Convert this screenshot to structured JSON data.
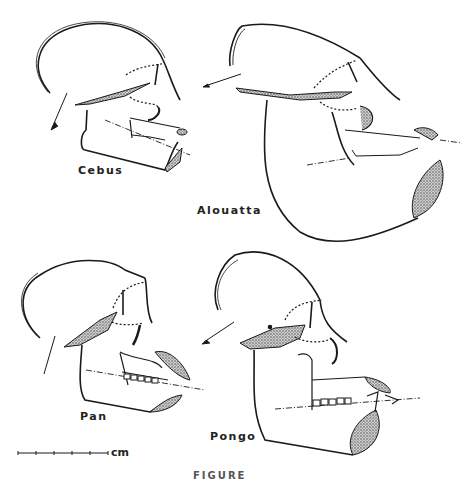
{
  "figure": {
    "caption": "FIGURE",
    "panels": [
      {
        "id": "cebus",
        "label": "Cebus"
      },
      {
        "id": "alouatta",
        "label": "Alouatta"
      },
      {
        "id": "pan",
        "label": "Pan"
      },
      {
        "id": "pongo",
        "label": "Pongo"
      }
    ],
    "scale_bar": {
      "unit_label": "cm",
      "ticks": 6
    },
    "colors": {
      "ink": "#1a1a1a",
      "stipple": "#8a8a8a",
      "background": "#ffffff"
    }
  }
}
